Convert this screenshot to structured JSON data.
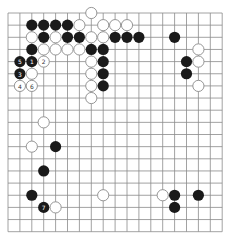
{
  "board": {
    "size": 19,
    "origin_x": 8,
    "origin_y": 13,
    "spacing_x": 11.9,
    "spacing_y": 12.15,
    "line_color": "#8a8a8a",
    "black_color": "#1a1a1a",
    "white_fill": "#ffffff",
    "white_stroke": "#8a8a8a",
    "stone_radius": 5.6
  },
  "stones": [
    {
      "col": 7,
      "row": 0,
      "color": "white",
      "label": ""
    },
    {
      "col": 2,
      "row": 1,
      "color": "black",
      "label": ""
    },
    {
      "col": 3,
      "row": 1,
      "color": "black",
      "label": ""
    },
    {
      "col": 4,
      "row": 1,
      "color": "black",
      "label": ""
    },
    {
      "col": 5,
      "row": 1,
      "color": "black",
      "label": ""
    },
    {
      "col": 6,
      "row": 1,
      "color": "white",
      "label": ""
    },
    {
      "col": 8,
      "row": 1,
      "color": "white",
      "label": ""
    },
    {
      "col": 9,
      "row": 1,
      "color": "white",
      "label": ""
    },
    {
      "col": 10,
      "row": 1,
      "color": "white",
      "label": ""
    },
    {
      "col": 2,
      "row": 2,
      "color": "white",
      "label": ""
    },
    {
      "col": 3,
      "row": 2,
      "color": "black",
      "label": ""
    },
    {
      "col": 4,
      "row": 2,
      "color": "white",
      "label": ""
    },
    {
      "col": 5,
      "row": 2,
      "color": "black",
      "label": ""
    },
    {
      "col": 6,
      "row": 2,
      "color": "black",
      "label": ""
    },
    {
      "col": 7,
      "row": 2,
      "color": "white",
      "label": ""
    },
    {
      "col": 8,
      "row": 2,
      "color": "white",
      "label": ""
    },
    {
      "col": 9,
      "row": 2,
      "color": "black",
      "label": ""
    },
    {
      "col": 10,
      "row": 2,
      "color": "black",
      "label": ""
    },
    {
      "col": 11,
      "row": 2,
      "color": "black",
      "label": ""
    },
    {
      "col": 14,
      "row": 2,
      "color": "black",
      "label": ""
    },
    {
      "col": 2,
      "row": 3,
      "color": "black",
      "label": ""
    },
    {
      "col": 3,
      "row": 3,
      "color": "white",
      "label": ""
    },
    {
      "col": 4,
      "row": 3,
      "color": "white",
      "label": ""
    },
    {
      "col": 5,
      "row": 3,
      "color": "white",
      "label": ""
    },
    {
      "col": 6,
      "row": 3,
      "color": "white",
      "label": ""
    },
    {
      "col": 7,
      "row": 3,
      "color": "black",
      "label": ""
    },
    {
      "col": 8,
      "row": 3,
      "color": "black",
      "label": ""
    },
    {
      "col": 16,
      "row": 3,
      "color": "white",
      "label": ""
    },
    {
      "col": 1,
      "row": 4,
      "color": "black",
      "label": "5"
    },
    {
      "col": 2,
      "row": 4,
      "color": "black",
      "label": "1"
    },
    {
      "col": 3,
      "row": 4,
      "color": "white",
      "label": "2"
    },
    {
      "col": 7,
      "row": 4,
      "color": "white",
      "label": ""
    },
    {
      "col": 8,
      "row": 4,
      "color": "black",
      "label": ""
    },
    {
      "col": 15,
      "row": 4,
      "color": "black",
      "label": ""
    },
    {
      "col": 16,
      "row": 4,
      "color": "white",
      "label": ""
    },
    {
      "col": 1,
      "row": 5,
      "color": "black",
      "label": "3"
    },
    {
      "col": 2,
      "row": 5,
      "color": "white",
      "label": ""
    },
    {
      "col": 7,
      "row": 5,
      "color": "white",
      "label": ""
    },
    {
      "col": 8,
      "row": 5,
      "color": "black",
      "label": ""
    },
    {
      "col": 15,
      "row": 5,
      "color": "black",
      "label": ""
    },
    {
      "col": 1,
      "row": 6,
      "color": "white",
      "label": "4"
    },
    {
      "col": 2,
      "row": 6,
      "color": "white",
      "label": "6"
    },
    {
      "col": 7,
      "row": 6,
      "color": "white",
      "label": ""
    },
    {
      "col": 8,
      "row": 6,
      "color": "black",
      "label": ""
    },
    {
      "col": 16,
      "row": 6,
      "color": "white",
      "label": ""
    },
    {
      "col": 7,
      "row": 7,
      "color": "white",
      "label": ""
    },
    {
      "col": 3,
      "row": 9,
      "color": "white",
      "label": ""
    },
    {
      "col": 2,
      "row": 11,
      "color": "white",
      "label": ""
    },
    {
      "col": 4,
      "row": 11,
      "color": "black",
      "label": ""
    },
    {
      "col": 3,
      "row": 13,
      "color": "black",
      "label": ""
    },
    {
      "col": 2,
      "row": 15,
      "color": "black",
      "label": ""
    },
    {
      "col": 8,
      "row": 15,
      "color": "white",
      "label": ""
    },
    {
      "col": 13,
      "row": 15,
      "color": "white",
      "label": ""
    },
    {
      "col": 14,
      "row": 15,
      "color": "black",
      "label": ""
    },
    {
      "col": 16,
      "row": 15,
      "color": "black",
      "label": ""
    },
    {
      "col": 3,
      "row": 16,
      "color": "black",
      "label": "7"
    },
    {
      "col": 4,
      "row": 16,
      "color": "white",
      "label": ""
    },
    {
      "col": 14,
      "row": 16,
      "color": "black",
      "label": ""
    }
  ]
}
